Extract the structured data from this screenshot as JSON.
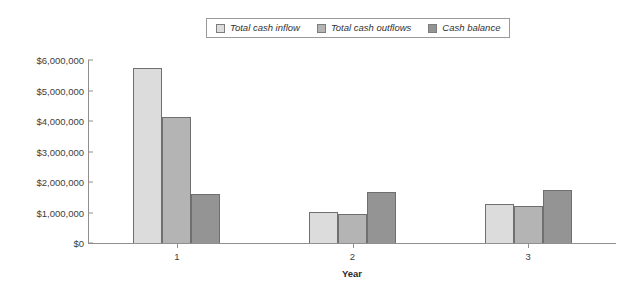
{
  "chart_data": {
    "type": "bar",
    "title": "",
    "xlabel": "Year",
    "ylabel": "",
    "categories": [
      "1",
      "2",
      "3"
    ],
    "series": [
      {
        "name": "Total cash inflow",
        "color": "#dcdcdc",
        "values": [
          5740000,
          1010000,
          1280000
        ]
      },
      {
        "name": "Total cash outflows",
        "color": "#b4b4b4",
        "values": [
          4130000,
          950000,
          1210000
        ]
      },
      {
        "name": "Cash balance",
        "color": "#949494",
        "values": [
          1600000,
          1670000,
          1740000
        ]
      }
    ],
    "ylim": [
      0,
      6000000
    ],
    "yticks": [
      0,
      1000000,
      2000000,
      3000000,
      4000000,
      5000000,
      6000000
    ],
    "ytick_labels": [
      "$0",
      "$1,000,000",
      "$2,000,000",
      "$3,000,000",
      "$4,000,000",
      "$5,000,000",
      "$6,000,000"
    ],
    "grid": false,
    "legend_position": "top-center"
  },
  "legend": {
    "entries": [
      {
        "label": "Total cash inflow"
      },
      {
        "label": "Total cash outflows"
      },
      {
        "label": "Cash balance"
      }
    ]
  },
  "axis": {
    "x_title": "Year"
  }
}
